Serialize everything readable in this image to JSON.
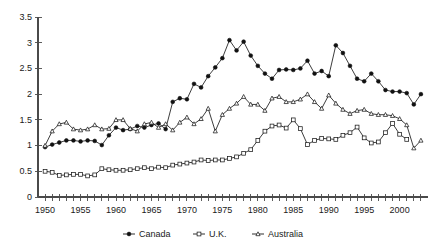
{
  "chart_data": {
    "type": "line",
    "title": "",
    "subtitle": "",
    "xlabel": "",
    "ylabel": "",
    "xlim": [
      1949,
      2004
    ],
    "ylim": [
      0,
      3.5
    ],
    "grid": false,
    "legend_position": "bottom",
    "y_ticks": [
      "0",
      "0.5",
      "1",
      "1.5",
      "2",
      "2.5",
      "3",
      "3.5"
    ],
    "y_tick_values": [
      0,
      0.5,
      1,
      1.5,
      2,
      2.5,
      3,
      3.5
    ],
    "x_tick_labels": [
      "1950",
      "1955",
      "1960",
      "1965",
      "1970",
      "1975",
      "1980",
      "1985",
      "1990",
      "1995",
      "2000"
    ],
    "x_tick_values": [
      1950,
      1955,
      1960,
      1965,
      1970,
      1975,
      1980,
      1985,
      1990,
      1995,
      2000
    ],
    "x_minor_start": 1950,
    "x_minor_end": 2003,
    "series": [
      {
        "name": "Canada",
        "marker": "filled-circle",
        "x": [
          1950,
          1951,
          1952,
          1953,
          1954,
          1955,
          1956,
          1957,
          1958,
          1959,
          1960,
          1961,
          1962,
          1963,
          1964,
          1965,
          1966,
          1967,
          1968,
          1969,
          1970,
          1971,
          1972,
          1973,
          1974,
          1975,
          1976,
          1977,
          1978,
          1979,
          1980,
          1981,
          1982,
          1983,
          1984,
          1985,
          1986,
          1987,
          1988,
          1989,
          1990,
          1991,
          1992,
          1993,
          1994,
          1995,
          1996,
          1997,
          1998,
          1999,
          2000,
          2001,
          2002,
          2003
        ],
        "values": [
          0.97,
          1.02,
          1.06,
          1.1,
          1.1,
          1.08,
          1.1,
          1.09,
          1.01,
          1.2,
          1.35,
          1.3,
          1.32,
          1.38,
          1.35,
          1.4,
          1.43,
          1.32,
          1.85,
          1.92,
          1.9,
          2.2,
          2.13,
          2.35,
          2.52,
          2.7,
          3.05,
          2.85,
          3.02,
          2.75,
          2.55,
          2.4,
          2.3,
          2.47,
          2.48,
          2.47,
          2.5,
          2.65,
          2.4,
          2.45,
          2.35,
          2.95,
          2.8,
          2.55,
          2.3,
          2.25,
          2.4,
          2.25,
          2.08,
          2.05,
          2.05,
          2.02,
          1.8,
          2.0
        ]
      },
      {
        "name": "U.K.",
        "marker": "open-square",
        "x": [
          1950,
          1951,
          1952,
          1953,
          1954,
          1955,
          1956,
          1957,
          1958,
          1959,
          1960,
          1961,
          1962,
          1963,
          1964,
          1965,
          1966,
          1967,
          1968,
          1969,
          1970,
          1971,
          1972,
          1973,
          1974,
          1975,
          1976,
          1977,
          1978,
          1979,
          1980,
          1981,
          1982,
          1983,
          1984,
          1985,
          1986,
          1987,
          1988,
          1989,
          1990,
          1991,
          1992,
          1993,
          1994,
          1995,
          1996,
          1997,
          1998,
          1999,
          2000,
          2001
        ],
        "values": [
          0.5,
          0.48,
          0.42,
          0.43,
          0.44,
          0.44,
          0.41,
          0.43,
          0.55,
          0.53,
          0.52,
          0.52,
          0.53,
          0.55,
          0.57,
          0.55,
          0.58,
          0.57,
          0.62,
          0.64,
          0.66,
          0.68,
          0.72,
          0.71,
          0.72,
          0.72,
          0.75,
          0.78,
          0.85,
          0.92,
          1.1,
          1.28,
          1.38,
          1.4,
          1.34,
          1.5,
          1.33,
          1.02,
          1.1,
          1.14,
          1.13,
          1.12,
          1.2,
          1.25,
          1.36,
          1.15,
          1.05,
          1.07,
          1.25,
          1.43,
          1.22,
          1.12
        ],
        "note": "series has a gap; resumes briefly near 1998-1999 at lower values"
      },
      {
        "name": "Australia",
        "marker": "open-triangle",
        "x": [
          1950,
          1951,
          1952,
          1953,
          1954,
          1955,
          1956,
          1957,
          1958,
          1959,
          1960,
          1961,
          1962,
          1963,
          1964,
          1965,
          1966,
          1967,
          1968,
          1969,
          1970,
          1971,
          1972,
          1973,
          1974,
          1975,
          1976,
          1977,
          1978,
          1979,
          1980,
          1981,
          1982,
          1983,
          1984,
          1985,
          1986,
          1987,
          1988,
          1989,
          1990,
          1991,
          1992,
          1993,
          1994,
          1995,
          1996,
          1997,
          1998,
          1999,
          2000,
          2001,
          2002,
          2003
        ],
        "values": [
          1.0,
          1.28,
          1.42,
          1.45,
          1.32,
          1.3,
          1.32,
          1.4,
          1.32,
          1.33,
          1.5,
          1.5,
          1.33,
          1.28,
          1.42,
          1.45,
          1.35,
          1.42,
          1.3,
          1.45,
          1.55,
          1.42,
          1.52,
          1.72,
          1.28,
          1.6,
          1.72,
          1.82,
          1.95,
          1.8,
          1.8,
          1.68,
          1.92,
          1.95,
          1.85,
          1.85,
          1.9,
          2.0,
          1.85,
          1.72,
          1.98,
          1.82,
          1.7,
          1.62,
          1.68,
          1.7,
          1.62,
          1.6,
          1.6,
          1.58,
          1.52,
          1.4,
          0.95,
          1.1
        ]
      }
    ]
  },
  "legend": {
    "items": [
      {
        "label": "Canada",
        "marker": "filled-circle"
      },
      {
        "label": "U.K.",
        "marker": "open-square"
      },
      {
        "label": "Australia",
        "marker": "open-triangle"
      }
    ]
  }
}
